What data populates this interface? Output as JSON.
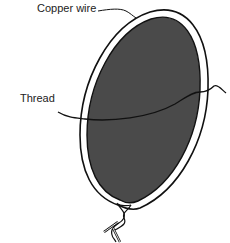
{
  "figure": {
    "labels": {
      "copper_wire": "Copper wire",
      "thread": "Thread"
    },
    "colors": {
      "membrane": "#4a4a4a",
      "wire_outline": "#111111",
      "wire_fill": "#ffffff",
      "thread": "#111111"
    }
  }
}
